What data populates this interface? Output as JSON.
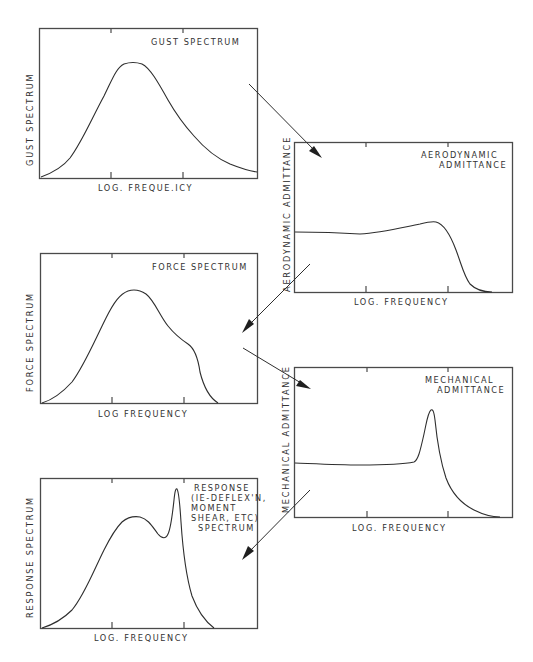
{
  "diagram": {
    "panels": [
      {
        "id": "gust",
        "title_lines": [
          "GUST  SPECTRUM"
        ],
        "y_label": "GUST   SPECTRUM",
        "x_label": "LOG.  FREQUE.ICY"
      },
      {
        "id": "aero",
        "title_lines": [
          "AERODYNAMIC",
          "ADMITTANCE"
        ],
        "y_label": "AERODYNAMIC   ADMITTANCE",
        "x_label": "LOG.   FREQUENCY"
      },
      {
        "id": "force",
        "title_lines": [
          "FORCE  SPECTRUM"
        ],
        "y_label": "FORCE   SPECTRUM",
        "x_label": "LOG    FREQUENCY"
      },
      {
        "id": "mech",
        "title_lines": [
          "MECHANICAL",
          "ADMITTANCE"
        ],
        "y_label": "MECHANICAL   ADMITTANCE",
        "x_label": "LOG.   FREQUENCY"
      },
      {
        "id": "response",
        "title_lines": [
          "RESPONSE",
          "(IE-DEFLEX'N,",
          "MOMENT",
          "SHEAR, ETC)",
          "SPECTRUM"
        ],
        "y_label": "RESPONSE   SPECTRUM",
        "x_label": "LOG.   FREQUENCY"
      }
    ],
    "flow": [
      {
        "from": "gust",
        "to": "aero"
      },
      {
        "from": "aero",
        "to": "force"
      },
      {
        "from": "force",
        "to": "mech"
      },
      {
        "from": "mech",
        "to": "response"
      }
    ],
    "colors": {
      "line": "#2e2e2e",
      "background": "#ffffff"
    }
  }
}
